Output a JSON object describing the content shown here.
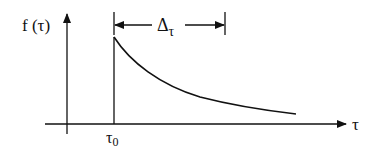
{
  "diagram": {
    "y_axis_label": "f (τ)",
    "x_axis_label": "τ",
    "start_marker_label": "τ",
    "start_marker_subscript": "0",
    "interval_label": "Δ",
    "interval_subscript": "τ",
    "colors": {
      "stroke": "#111111",
      "background": "#ffffff"
    }
  }
}
